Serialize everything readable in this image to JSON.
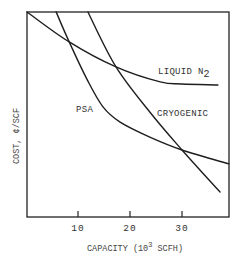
{
  "chart_data": {
    "type": "line",
    "title": "",
    "xlabel": "CAPACITY (10³ SCFH)",
    "xlabel_parts": {
      "prefix": "CAPACITY (10",
      "sup": "3",
      "suffix": " SCFH)"
    },
    "ylabel": "COST, ¢/SCF",
    "xlim": [
      0,
      39
    ],
    "ylim": [
      0,
      100
    ],
    "y_units_note": "relative (no y ticks shown)",
    "grid": false,
    "legend": "inline labels",
    "x_ticks": [
      10,
      20,
      30
    ],
    "x_tick_labels": [
      "10",
      "20",
      "30"
    ],
    "series": [
      {
        "name": "LIQUID N2",
        "label_main": "LIQUID N",
        "label_sub": "2",
        "points": [
          [
            0.2,
            100
          ],
          [
            8.3,
            85.4
          ],
          [
            17.3,
            73.2
          ],
          [
            25.8,
            65.9
          ],
          [
            30,
            64.9
          ],
          [
            36.9,
            64.4
          ]
        ]
      },
      {
        "name": "PSA",
        "label_main": "PSA",
        "points": [
          [
            5.8,
            100
          ],
          [
            8.3,
            85.4
          ],
          [
            11.8,
            66.8
          ],
          [
            14.8,
            53.7
          ],
          [
            18.1,
            46.3
          ],
          [
            23.8,
            39.0
          ],
          [
            30,
            32.7
          ],
          [
            39.0,
            25.9
          ]
        ]
      },
      {
        "name": "CRYOGENIC",
        "label_main": "CRYOGENIC",
        "points": [
          [
            11.9,
            100
          ],
          [
            17.3,
            73.2
          ],
          [
            23.8,
            51.2
          ],
          [
            30,
            32.7
          ],
          [
            37.3,
            12.2
          ]
        ]
      }
    ],
    "intersections": [
      {
        "series": [
          "PSA",
          "LIQUID N2"
        ],
        "x": 8.3
      },
      {
        "series": [
          "CRYOGENIC",
          "LIQUID N2"
        ],
        "x": 17.3
      },
      {
        "series": [
          "PSA",
          "CRYOGENIC"
        ],
        "x": 30
      }
    ]
  },
  "colors": {
    "line": "#1e1e1e",
    "frame": "#222222",
    "text": "#333333",
    "background": "#ffffff"
  }
}
